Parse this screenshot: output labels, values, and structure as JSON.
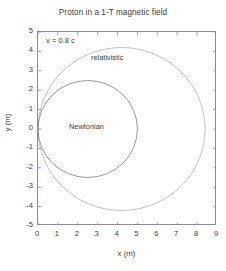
{
  "chart_data": {
    "type": "line",
    "title": "Proton in a 1-T magnetic field",
    "xlabel": "x (m)",
    "ylabel": "y (m)",
    "xlim": [
      0,
      9
    ],
    "ylim": [
      -5,
      5
    ],
    "xticks": [
      0,
      1,
      2,
      3,
      4,
      5,
      6,
      7,
      8,
      9
    ],
    "yticks": [
      5,
      4,
      3,
      2,
      1,
      0,
      -1,
      -2,
      -3,
      -4,
      -5
    ],
    "xtick_labels": [
      "0",
      "1",
      "2",
      "3",
      "4",
      "5",
      "6",
      "7",
      "8",
      "9"
    ],
    "ytick_labels": [
      "5",
      "4",
      "3",
      "2",
      "1",
      "0",
      "-1",
      "-2",
      "-3",
      "-4",
      "-5"
    ],
    "grid": false,
    "legend": "none",
    "frame": "box",
    "tick_direction": "in",
    "annotations": [
      {
        "text": "v = 0.8 c",
        "x": 0.35,
        "y": 4.55
      },
      {
        "text": "relativistic",
        "x": 3.1,
        "y": 3.55
      },
      {
        "text": "Newtonian",
        "x": 2.1,
        "y": -0.15
      }
    ],
    "series": [
      {
        "name": "relativistic",
        "shape": "circle",
        "center": [
          4.2,
          0.0
        ],
        "radius": 4.2,
        "color": "#a8a8a8",
        "linewidth": 0.7
      },
      {
        "name": "Newtonian",
        "shape": "circle",
        "center": [
          2.5,
          0.0
        ],
        "radius": 2.5,
        "color": "#6f6f6f",
        "linewidth": 0.7
      }
    ]
  },
  "colors": {
    "background": "#ffffff",
    "axis": "#8d8d8d",
    "text": "#3d3d3d",
    "relativistic": "#a8a8a8",
    "newtonian": "#6f6f6f"
  }
}
